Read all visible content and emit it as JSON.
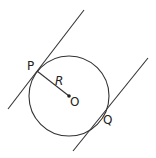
{
  "diagram": {
    "labels": {
      "P": "P",
      "R": "R",
      "O": "O",
      "Q": "Q"
    },
    "stroke_color": "#333333"
  }
}
